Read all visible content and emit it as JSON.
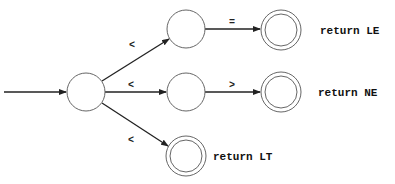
{
  "diagram": {
    "type": "finite-automaton",
    "start_arrow": {
      "from": [
        4,
        92
      ],
      "to": [
        67,
        92
      ]
    },
    "states": [
      {
        "id": "s0",
        "cx": 86,
        "cy": 92,
        "r": 19,
        "accepting": false,
        "start": true
      },
      {
        "id": "s1",
        "cx": 186,
        "cy": 29,
        "r": 19,
        "accepting": false
      },
      {
        "id": "s2",
        "cx": 186,
        "cy": 92,
        "r": 19,
        "accepting": false
      },
      {
        "id": "s3",
        "cx": 281,
        "cy": 30,
        "r": 20,
        "accepting": true,
        "action": "return LE"
      },
      {
        "id": "s4",
        "cx": 281,
        "cy": 92,
        "r": 20,
        "accepting": true,
        "action": "return NE"
      },
      {
        "id": "s5",
        "cx": 186,
        "cy": 156,
        "r": 20,
        "accepting": true,
        "action": "return LT"
      }
    ],
    "edges": [
      {
        "from": "s0",
        "to": "s1",
        "label": "<"
      },
      {
        "from": "s0",
        "to": "s2",
        "label": "<"
      },
      {
        "from": "s0",
        "to": "s5",
        "label": "<"
      },
      {
        "from": "s1",
        "to": "s3",
        "label": "="
      },
      {
        "from": "s2",
        "to": "s4",
        "label": ">"
      }
    ],
    "labels": {
      "e01": "<",
      "e02": "<",
      "e05": "<",
      "e13": "=",
      "e24": ">",
      "le": "return LE",
      "ne": "return NE",
      "lt": "return LT"
    }
  }
}
